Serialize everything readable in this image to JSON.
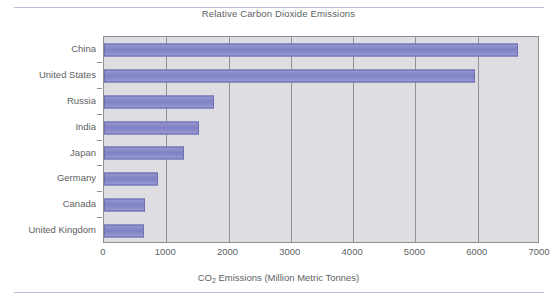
{
  "chart_data": {
    "type": "bar",
    "orientation": "horizontal",
    "title": "Relative Carbon Dioxide Emissions",
    "xlabel_parts": {
      "pre": "CO",
      "sub": "2",
      "post": " Emissions (Million Metric Tonnes)"
    },
    "xlabel": "CO2 Emissions (Million Metric Tonnes)",
    "ylabel": "",
    "categories": [
      "China",
      "United States",
      "Russia",
      "India",
      "Japan",
      "Germany",
      "Canada",
      "United Kingdom"
    ],
    "values": [
      6650,
      5950,
      1760,
      1530,
      1290,
      860,
      660,
      650
    ],
    "xlim": [
      0,
      7000
    ],
    "xticks": [
      "0",
      "1000",
      "2000",
      "3000",
      "4000",
      "5000",
      "6000",
      "7000"
    ],
    "xtick_values": [
      0,
      1000,
      2000,
      3000,
      4000,
      5000,
      6000,
      7000
    ],
    "grid": "vertical",
    "legend": "none",
    "bar_color": "#8284c6",
    "plot_background": "#dddde2",
    "axis_color": "#8e9096",
    "text_color": "#5d5f63"
  }
}
